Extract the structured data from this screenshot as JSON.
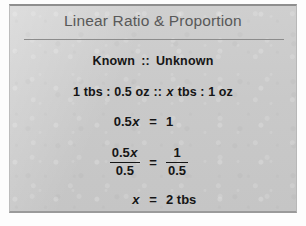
{
  "figure": {
    "title": "Linear Ratio & Proportion",
    "heading": {
      "known_label": "Known",
      "separator": "::",
      "unknown_label": "Unknown"
    },
    "proportion": {
      "known_ratio": "1 tbs : 0.5 oz",
      "separator": "::",
      "unknown_ratio_before_var": "",
      "variable": "x",
      "unknown_ratio_after_var": " tbs : 1 oz"
    },
    "steps": [
      {
        "lhs_prefix": "0.5",
        "lhs_variable": "x",
        "operator": "=",
        "rhs": "1"
      },
      {
        "lhs_numerator_prefix": "0.5",
        "lhs_numerator_variable": "x",
        "lhs_denominator": "0.5",
        "operator": "=",
        "rhs_numerator": "1",
        "rhs_denominator": "0.5"
      },
      {
        "lhs_variable": "x",
        "operator": "=",
        "rhs": "2 tbs"
      }
    ],
    "colors": {
      "panel_background": "#c9c9c9",
      "panel_border": "#8e8e8e",
      "title_text": "#595959",
      "body_text": "#151515",
      "rule": "#8c8c8c",
      "page_background": "#fdfdfd"
    }
  }
}
